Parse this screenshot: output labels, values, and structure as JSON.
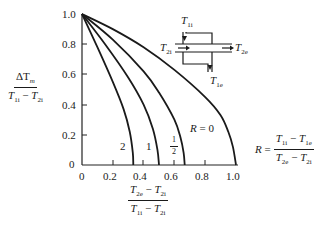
{
  "chart_data": {
    "type": "line",
    "title": "",
    "xlabel": "(T2e - T2i) / (T1i - T2i)",
    "ylabel": "ΔTm / (T1i - T2i)",
    "xlim": [
      0,
      1.0
    ],
    "ylim": [
      0,
      1.0
    ],
    "x_ticks": [
      "0",
      "0.2",
      "0.4",
      "0.6",
      "0.8",
      "1.0"
    ],
    "y_ticks": [
      "0",
      "0.2",
      "0.4",
      "0.6",
      "0.8",
      "1.0"
    ],
    "grid": false,
    "legend": "inline curve labels",
    "series": [
      {
        "name": "R = 0",
        "label": "R = 0",
        "x": [
          0,
          0.2,
          0.4,
          0.6,
          0.8,
          0.9,
          0.95,
          0.98,
          1.0
        ],
        "y": [
          1.0,
          0.9,
          0.78,
          0.63,
          0.45,
          0.33,
          0.22,
          0.12,
          0
        ]
      },
      {
        "name": "R = 1/2",
        "label": "1/2",
        "x": [
          0,
          0.2,
          0.4,
          0.5,
          0.6,
          0.64,
          0.66,
          0.667
        ],
        "y": [
          1.0,
          0.83,
          0.62,
          0.48,
          0.3,
          0.18,
          0.08,
          0
        ]
      },
      {
        "name": "R = 1",
        "label": "1",
        "x": [
          0,
          0.15,
          0.3,
          0.4,
          0.46,
          0.49,
          0.5
        ],
        "y": [
          1.0,
          0.8,
          0.58,
          0.4,
          0.24,
          0.1,
          0
        ]
      },
      {
        "name": "R = 2",
        "label": "2",
        "x": [
          0,
          0.1,
          0.2,
          0.27,
          0.31,
          0.33,
          0.333
        ],
        "y": [
          1.0,
          0.78,
          0.55,
          0.37,
          0.22,
          0.08,
          0
        ]
      }
    ],
    "annotations": [
      "R = (T1i - T1e) / (T2e - T2i)",
      "Heat exchanger schematic with streams T1i, T1e, T2i, T2e"
    ]
  },
  "labels": {
    "ylabel_num": "ΔT",
    "ylabel_num_sub": "m",
    "ylabel_den_a": "T",
    "ylabel_den_a_sub": "1i",
    "ylabel_den_b": "T",
    "ylabel_den_b_sub": "2i",
    "xlabel_num_a": "T",
    "xlabel_num_a_sub": "2e",
    "xlabel_num_b": "T",
    "xlabel_num_b_sub": "2i",
    "xlabel_den_a": "T",
    "xlabel_den_a_sub": "1i",
    "xlabel_den_b": "T",
    "xlabel_den_b_sub": "2i",
    "minus": "−",
    "r_eq": "R =",
    "r_num_a": "T",
    "r_num_a_sub": "1i",
    "r_num_b": "T",
    "r_num_b_sub": "1e",
    "r_den_a": "T",
    "r_den_a_sub": "2e",
    "r_den_b": "T",
    "r_den_b_sub": "2i",
    "curve_r0": "R = 0",
    "curve_half_num": "1",
    "curve_half_den": "2",
    "curve_one": "1",
    "curve_two": "2",
    "hx_t1i": "T",
    "hx_t1i_sub": "1i",
    "hx_t1e": "T",
    "hx_t1e_sub": "1e",
    "hx_t2i": "T",
    "hx_t2i_sub": "2i",
    "hx_t2e": "T",
    "hx_t2e_sub": "2e"
  }
}
